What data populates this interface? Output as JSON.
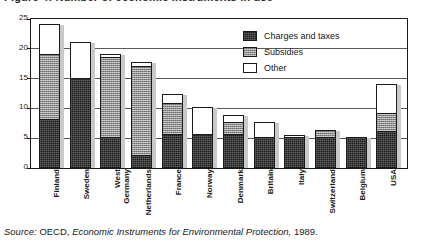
{
  "figure": {
    "title": "Figure 4:  Number of economic instruments in use",
    "source_label": "Source:",
    "source_org": "OECD,",
    "source_title": "Economic Instruments for Environmental Protection,",
    "source_year": "1989."
  },
  "legend": {
    "position": "top-right",
    "items": [
      {
        "label": "Charges and taxes",
        "key": "charges",
        "color": "#1c1c1c",
        "swatch": "black-solid-swatch"
      },
      {
        "label": "Subsidies",
        "key": "subsidies",
        "color": "#8d8d8d",
        "swatch": "gray-hatched-swatch"
      },
      {
        "label": "Other",
        "key": "other",
        "color": "#ffffff",
        "swatch": "white-swatch"
      }
    ]
  },
  "chart_data": {
    "type": "bar",
    "stacked": true,
    "title": "Figure 4:  Number of economic instruments in use",
    "xlabel": "",
    "ylabel": "",
    "ylim": [
      0,
      25
    ],
    "yticks": [
      0,
      5,
      10,
      15,
      20,
      25
    ],
    "grid": true,
    "grid_axis": "y",
    "legend_position": "top-right",
    "categories": [
      "Finland",
      "Sweden",
      "West Germany",
      "Netherlands",
      "France",
      "Norway",
      "Denmark",
      "Britain",
      "Italy",
      "Switzerland",
      "Belgium",
      "USA"
    ],
    "series": [
      {
        "name": "Charges and taxes",
        "color": "#1c1c1c",
        "values": [
          8,
          15,
          5,
          2,
          5.5,
          5.5,
          5.5,
          5,
          5,
          5,
          5,
          6
        ]
      },
      {
        "name": "Subsidies",
        "color": "#8d8d8d",
        "values": [
          11,
          0,
          13.5,
          15,
          5.2,
          0,
          2,
          0,
          0,
          1.2,
          0,
          3
        ]
      },
      {
        "name": "Other",
        "color": "#ffffff",
        "values": [
          5,
          6,
          0.5,
          0.7,
          1.5,
          4.5,
          1.3,
          2.5,
          0.3,
          0,
          0,
          5
        ]
      }
    ],
    "totals": [
      24,
      21,
      19,
      17.7,
      12.2,
      10,
      8.8,
      7.5,
      5.3,
      6.2,
      5,
      14
    ]
  }
}
